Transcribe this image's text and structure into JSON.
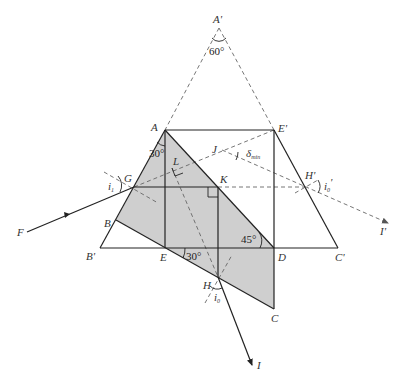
{
  "diagram": {
    "type": "optics-prism-geometry",
    "colors": {
      "shade": "#cfcfcf",
      "solid_line": "#222222",
      "dashed_line": "#666666",
      "text": "#333333"
    },
    "points": {
      "A_prime": {
        "label": "A'",
        "x": 219,
        "y": 28
      },
      "A": {
        "label": "A",
        "x": 165,
        "y": 130
      },
      "E_prime": {
        "label": "E'",
        "x": 274,
        "y": 130
      },
      "G": {
        "label": "G",
        "x": 134,
        "y": 187
      },
      "L": {
        "label": "L",
        "x": 172,
        "y": 168
      },
      "K": {
        "label": "K",
        "x": 218,
        "y": 187
      },
      "J": {
        "label": "J",
        "x": 222,
        "y": 150
      },
      "H_prime": {
        "label": "H'",
        "x": 305,
        "y": 187
      },
      "B": {
        "label": "B",
        "x": 116,
        "y": 220
      },
      "B_prime": {
        "label": "B'",
        "x": 100,
        "y": 248
      },
      "E": {
        "label": "E",
        "x": 165,
        "y": 248
      },
      "D": {
        "label": "D",
        "x": 274,
        "y": 248
      },
      "C_prime": {
        "label": "C'",
        "x": 338,
        "y": 248
      },
      "H": {
        "label": "H",
        "x": 218,
        "y": 277
      },
      "C": {
        "label": "C",
        "x": 274,
        "y": 309
      },
      "F": {
        "label": "F",
        "x": 27,
        "y": 232
      },
      "I": {
        "label": "I",
        "x": 252,
        "y": 365
      },
      "I_prime": {
        "label": "I'",
        "x": 388,
        "y": 223
      }
    },
    "angles": {
      "apex": "60°",
      "at_A": "30°",
      "at_D": "45°",
      "at_E": "30°"
    },
    "symbols": {
      "i1": {
        "main": "i",
        "sub": "1"
      },
      "i0": {
        "main": "i",
        "sub": "0"
      },
      "i0_prime": {
        "main": "i",
        "sub": "0",
        "prime": "'"
      },
      "delta_min": {
        "main": "δ",
        "sub": "min"
      }
    }
  }
}
